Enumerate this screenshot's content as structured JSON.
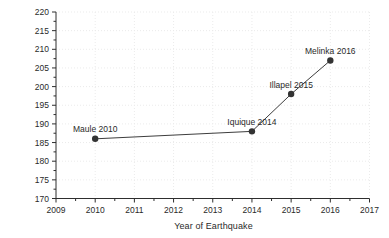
{
  "figure": {
    "background": "#ffffff",
    "axis_color": "#2e2e2e",
    "text_color": "#2a2a2a",
    "grid_color": "#ebebeb",
    "line_color": "#3d3d3d",
    "marker_color": "#333333"
  },
  "chart_data": {
    "type": "line",
    "title": "",
    "xlabel": "Year of Earthquake",
    "ylabel": "Cumulative Case-history Data Compiled",
    "x": [
      2010,
      2014,
      2015,
      2016
    ],
    "values": [
      186,
      188,
      198,
      207
    ],
    "point_labels": [
      "Maule 2010",
      "Iquique 2014",
      "Illapel 2015",
      "Melinka 2016"
    ],
    "xlim": [
      2009,
      2017
    ],
    "ylim": [
      170,
      220
    ],
    "x_tick_step": 1,
    "y_tick_step": 5,
    "x_minor_tick_step": 0.5,
    "y_minor_tick_step": 2.5,
    "grid": "dotted",
    "legend": null,
    "marker": "filled-circle"
  }
}
